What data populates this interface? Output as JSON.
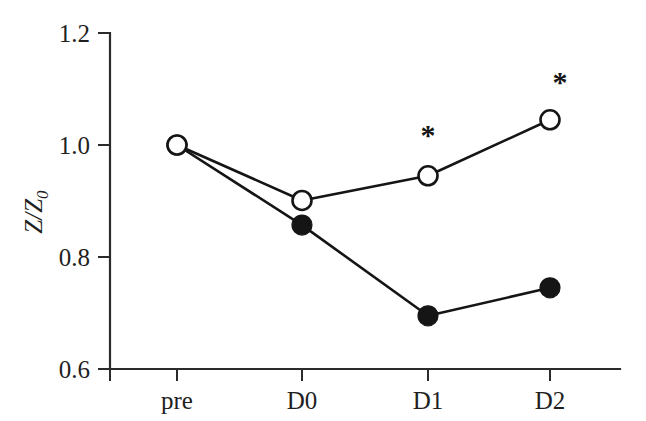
{
  "chart_data": {
    "type": "line",
    "title": "",
    "xlabel": "",
    "ylabel": "Z/Z0",
    "ylabel_main": "Z/Z",
    "ylabel_sub": "0",
    "categories": [
      "pre",
      "D0",
      "D1",
      "D2"
    ],
    "ylim": [
      0.6,
      1.2
    ],
    "yticks": [
      0.6,
      0.8,
      1.0,
      1.2
    ],
    "ytick_labels": [
      "0.6",
      "0.8",
      "1.0",
      "1.2"
    ],
    "grid": false,
    "legend": "none",
    "series": [
      {
        "name": "open-circle-series",
        "marker": "open-circle",
        "values": [
          1.0,
          0.901,
          0.945,
          1.045
        ]
      },
      {
        "name": "filled-circle-series",
        "marker": "filled-circle",
        "values": [
          1.0,
          0.857,
          0.695,
          0.745
        ]
      }
    ],
    "annotations": [
      {
        "text": "*",
        "category": "D1",
        "value": 1.02
      },
      {
        "text": "*",
        "category": "D2",
        "value": 1.115
      }
    ]
  },
  "axes": {
    "y_tick_0": "1.2",
    "y_tick_1": "1.0",
    "y_tick_2": "0.8",
    "y_tick_3": "0.6",
    "x_tick_0": "pre",
    "x_tick_1": "D0",
    "x_tick_2": "D1",
    "x_tick_3": "D2",
    "y_title_main": "Z/Z",
    "y_title_sub": "0"
  },
  "marks": {
    "star_d1": "*",
    "star_d2": "*"
  },
  "colors": {
    "background": "#ffffff",
    "ink": "#151515",
    "axis": "#2b2b2b",
    "marker_open_fill": "#ffffff"
  }
}
